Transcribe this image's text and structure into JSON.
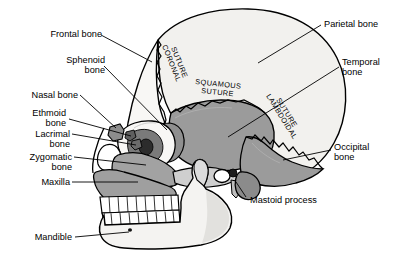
{
  "diagram": {
    "view": "left lateral",
    "colors": {
      "outline": "#000000",
      "background": "#ffffff",
      "bone_light": "#f2f1ee",
      "bone_mid": "#9b9b9b",
      "bone_dark": "#6e6e6e",
      "teeth": "#ffffff",
      "leader_line": "#000000"
    }
  },
  "labels": {
    "frontal_bone": "Frontal bone",
    "sphenoid_bone_1": "Sphenoid",
    "sphenoid_bone_2": "bone",
    "nasal_bone": "Nasal bone",
    "ethmoid_bone_1": "Ethmoid",
    "ethmoid_bone_2": "bone",
    "lacrimal_bone_1": "Lacrimal",
    "lacrimal_bone_2": "bone",
    "zygomatic_bone_1": "Zygomatic",
    "zygomatic_bone_2": "bone",
    "maxilla": "Maxilla",
    "mandible": "Mandible",
    "parietal_bone": "Parietal bone",
    "temporal_bone_1": "Temporal",
    "temporal_bone_2": "bone",
    "occipital_bone_1": "Occipital",
    "occipital_bone_2": "bone",
    "mastoid_process": "Mastoid process"
  },
  "sutures": {
    "coronal_1": "CORONAL",
    "coronal_2": "SUTURE",
    "squamous_1": "SQUAMOUS",
    "squamous_2": "SUTURE",
    "lambdoidal_1": "LAMBDOIDAL",
    "lambdoidal_2": "SUTURE"
  }
}
